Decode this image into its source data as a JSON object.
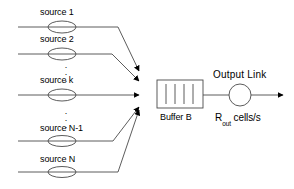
{
  "diagram": {
    "colors": {
      "stroke": "#4a4a4a",
      "text": "#000000",
      "background": "#ffffff",
      "arrowhead": "#000000"
    },
    "sources": [
      {
        "id": "source-1",
        "label": "source 1",
        "ellipse_cx": 62,
        "ellipse_cy": 27,
        "line_y": 27
      },
      {
        "id": "source-2",
        "label": "source 2",
        "ellipse_cx": 62,
        "ellipse_cy": 54,
        "line_y": 54
      },
      {
        "id": "source-k",
        "label": "source k",
        "ellipse_cx": 62,
        "ellipse_cy": 95,
        "line_y": 95
      },
      {
        "id": "source-n-1",
        "label": "source N-1",
        "ellipse_cx": 62,
        "ellipse_cy": 141,
        "line_y": 141
      },
      {
        "id": "source-n",
        "label": "source N",
        "ellipse_cx": 62,
        "ellipse_cy": 172,
        "line_y": 172
      }
    ],
    "vertical_ellipsis": [
      {
        "id": "ellipsis-upper",
        "glyph": "."
      },
      {
        "id": "ellipsis-lower",
        "glyph": "."
      }
    ],
    "buffer": {
      "label": "Buffer B",
      "cells": 4,
      "x": 157,
      "y": 80,
      "width": 46,
      "height": 28
    },
    "output_link": {
      "label": "Output Link",
      "rate_prefix": "R",
      "rate_subscript": "out",
      "rate_suffix": "cells/s",
      "circle_cx": 240,
      "circle_cy": 95,
      "circle_r": 11
    }
  }
}
